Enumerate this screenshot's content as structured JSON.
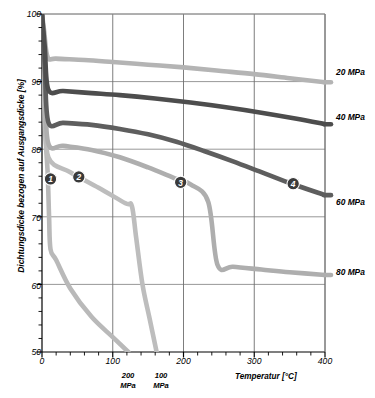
{
  "chart_data": {
    "type": "line",
    "title": "",
    "xlabel": "Temperatur [°C]",
    "ylabel": "Dichtungsdicke bezogen auf Ausgangsdicke [%]",
    "xlim": [
      0,
      400
    ],
    "ylim": [
      50,
      100
    ],
    "xticks": [
      0,
      100,
      200,
      300,
      400
    ],
    "yticks": [
      50,
      60,
      70,
      80,
      90,
      100
    ],
    "xtick_labels": [
      "0",
      "100",
      "200",
      "300",
      "400"
    ],
    "ytick_labels": [
      "50",
      "60",
      "70",
      "80",
      "90",
      "100"
    ],
    "x_minor_step": 20,
    "y_minor_step": 2,
    "grid": true,
    "grid_axes": "both-major",
    "legend_position": "right-of-plot",
    "series": [
      {
        "name": "20 MPa",
        "label": "20 MPa",
        "color": "#b4b4b4",
        "marker_label": "1",
        "points": [
          [
            0,
            100
          ],
          [
            3,
            97.5
          ],
          [
            8,
            93.6
          ],
          [
            20,
            93.4
          ],
          [
            60,
            93.2
          ],
          [
            100,
            92.9
          ],
          [
            150,
            92.5
          ],
          [
            200,
            92.1
          ],
          [
            250,
            91.6
          ],
          [
            300,
            91.1
          ],
          [
            350,
            90.5
          ],
          [
            400,
            89.9
          ]
        ]
      },
      {
        "name": "40 MPa",
        "label": "40 MPa",
        "color": "#4d4d4d",
        "marker_label": "2",
        "points": [
          [
            0,
            100
          ],
          [
            4,
            95.0
          ],
          [
            9,
            88.8
          ],
          [
            30,
            88.6
          ],
          [
            70,
            88.3
          ],
          [
            110,
            88.0
          ],
          [
            160,
            87.5
          ],
          [
            210,
            86.9
          ],
          [
            260,
            86.2
          ],
          [
            310,
            85.4
          ],
          [
            360,
            84.5
          ],
          [
            400,
            83.7
          ]
        ]
      },
      {
        "name": "60 MPa",
        "label": "60 MPa",
        "color": "#5e5e5e",
        "marker_label": "3",
        "points": [
          [
            0,
            100
          ],
          [
            4,
            92.0
          ],
          [
            9,
            84.0
          ],
          [
            30,
            83.9
          ],
          [
            70,
            83.6
          ],
          [
            110,
            83.0
          ],
          [
            150,
            82.2
          ],
          [
            190,
            81.1
          ],
          [
            230,
            79.7
          ],
          [
            270,
            78.2
          ],
          [
            310,
            76.6
          ],
          [
            350,
            75.0
          ],
          [
            400,
            73.2
          ]
        ]
      },
      {
        "name": "80 MPa",
        "label": "80 MPa",
        "color": "#aeaeae",
        "marker_label": "4",
        "points": [
          [
            0,
            100
          ],
          [
            4,
            89.0
          ],
          [
            9,
            80.8
          ],
          [
            30,
            80.5
          ],
          [
            70,
            79.9
          ],
          [
            110,
            78.8
          ],
          [
            150,
            77.3
          ],
          [
            190,
            75.6
          ],
          [
            210,
            74.8
          ],
          [
            235,
            72.2
          ],
          [
            248,
            62.9
          ],
          [
            270,
            62.6
          ],
          [
            310,
            62.2
          ],
          [
            350,
            61.8
          ],
          [
            400,
            61.4
          ]
        ]
      },
      {
        "name": "200 MPa",
        "label": "200 MPa",
        "color": "#b9b9b9",
        "marker_label": "",
        "points": [
          [
            0,
            100
          ],
          [
            4,
            84.0
          ],
          [
            8,
            76.5
          ],
          [
            10,
            70.0
          ],
          [
            12,
            65.2
          ],
          [
            20,
            63.6
          ],
          [
            40,
            59.4
          ],
          [
            70,
            55.2
          ],
          [
            100,
            52.2
          ],
          [
            122,
            50.0
          ]
        ]
      },
      {
        "name": "100 MPa",
        "label": "100 MPa",
        "color": "#bdbdbd",
        "marker_label": "",
        "points": [
          [
            0,
            100
          ],
          [
            5,
            86.0
          ],
          [
            9,
            78.8
          ],
          [
            40,
            76.6
          ],
          [
            80,
            74.3
          ],
          [
            118,
            72.0
          ],
          [
            127,
            71.6
          ],
          [
            133,
            67.0
          ],
          [
            142,
            60.0
          ],
          [
            152,
            55.0
          ],
          [
            162,
            50.0
          ]
        ]
      }
    ],
    "point_markers": [
      {
        "label": "1",
        "x": 12,
        "y": 75.6
      },
      {
        "label": "2",
        "x": 52,
        "y": 75.9
      },
      {
        "label": "3",
        "x": 196,
        "y": 75.1
      },
      {
        "label": "4",
        "x": 355,
        "y": 74.9
      }
    ],
    "annotations": [
      {
        "text": "200\nMPa",
        "x": 122,
        "below_axis": true
      },
      {
        "text": "100\nMPa",
        "x": 168,
        "below_axis": true
      }
    ]
  },
  "axes": {
    "y_title": "Dichtungsdicke bezogen auf Ausgangsdicke [%]",
    "x_title": "Temperatur [°C]"
  }
}
